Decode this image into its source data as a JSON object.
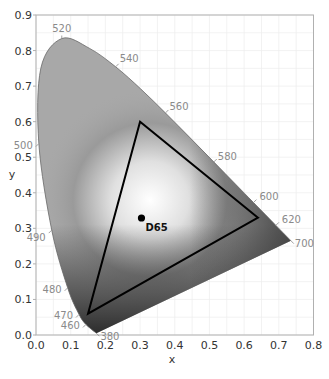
{
  "chart_data": {
    "type": "scatter",
    "title": "",
    "xlabel": "x",
    "ylabel": "y",
    "xlim": [
      0.0,
      0.8
    ],
    "ylim": [
      0.0,
      0.9
    ],
    "grid": true,
    "x_ticks": [
      "0.0",
      "0.1",
      "0.2",
      "0.3",
      "0.4",
      "0.5",
      "0.6",
      "0.7",
      "0.8"
    ],
    "y_ticks": [
      "0.0",
      "0.1",
      "0.2",
      "0.3",
      "0.4",
      "0.5",
      "0.6",
      "0.7",
      "0.8",
      "0.9"
    ],
    "spectral_locus": {
      "name": "CIE 1931 spectral locus",
      "points": [
        {
          "nm": 380,
          "x": 0.1741,
          "y": 0.005
        },
        {
          "nm": 460,
          "x": 0.144,
          "y": 0.0297
        },
        {
          "nm": 470,
          "x": 0.1241,
          "y": 0.0578
        },
        {
          "nm": 480,
          "x": 0.0913,
          "y": 0.1327
        },
        {
          "nm": 490,
          "x": 0.0454,
          "y": 0.295
        },
        {
          "nm": 500,
          "x": 0.0082,
          "y": 0.5384
        },
        {
          "nm": 510,
          "x": 0.0139,
          "y": 0.7502
        },
        {
          "nm": 520,
          "x": 0.0743,
          "y": 0.8338
        },
        {
          "nm": 530,
          "x": 0.1547,
          "y": 0.8059
        },
        {
          "nm": 540,
          "x": 0.2296,
          "y": 0.7543
        },
        {
          "nm": 550,
          "x": 0.3016,
          "y": 0.6923
        },
        {
          "nm": 560,
          "x": 0.3731,
          "y": 0.6245
        },
        {
          "nm": 570,
          "x": 0.4441,
          "y": 0.5547
        },
        {
          "nm": 580,
          "x": 0.5125,
          "y": 0.4866
        },
        {
          "nm": 590,
          "x": 0.5752,
          "y": 0.4242
        },
        {
          "nm": 600,
          "x": 0.627,
          "y": 0.3725
        },
        {
          "nm": 620,
          "x": 0.6915,
          "y": 0.3083
        },
        {
          "nm": 700,
          "x": 0.7347,
          "y": 0.2653
        }
      ],
      "labeled_wavelengths": [
        "380",
        "460",
        "470",
        "480",
        "490",
        "500",
        "520",
        "540",
        "560",
        "580",
        "600",
        "620",
        "700"
      ]
    },
    "gamut_triangle": {
      "name": "RGB gamut",
      "vertices": [
        {
          "label": "R",
          "x": 0.64,
          "y": 0.33
        },
        {
          "label": "G",
          "x": 0.3,
          "y": 0.6
        },
        {
          "label": "B",
          "x": 0.15,
          "y": 0.06
        }
      ]
    },
    "white_point": {
      "label": "D65",
      "x": 0.3127,
      "y": 0.329
    },
    "colors": {
      "locus_fill_light": "#f4f4f4",
      "locus_fill_mid": "#a8a8a8",
      "locus_fill_dark": "#2e2e2e",
      "triangle_stroke": "#000000",
      "grid": "#ececec",
      "axis": "#b0b0b0"
    }
  }
}
